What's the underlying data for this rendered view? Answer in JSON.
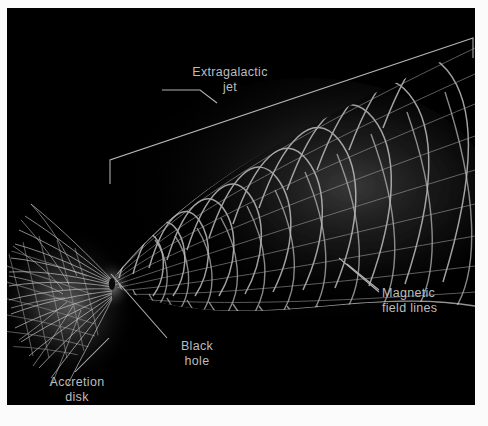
{
  "figure": {
    "background_color": "#000000",
    "mat_color": "#ffffff",
    "label_color": "#bcbcbc",
    "structure_color": "#d8d8d8"
  },
  "labels": {
    "extragalactic_jet": "Extragalactic\njet",
    "magnetic_field_lines": "Magnetic\nfield lines",
    "black_hole": "Black\nhole",
    "accretion_disk": "Accretion\ndisk"
  },
  "annotations": {
    "jet_bracket": "jet-extent-bracket",
    "magnetic_leader_upper": "magnetic-field-leader-upper",
    "magnetic_leader_lower": "magnetic-field-leader-lower",
    "black_hole_leader": "black-hole-leader-line",
    "accretion_disk_leader": "accretion-disk-leader-line"
  },
  "scene": {
    "jet_name": "helical-magnetic-jet",
    "disk_name": "accretion-disk",
    "counter_lobe_name": "counter-lobe",
    "nexus_name": "black-hole-nexus"
  }
}
